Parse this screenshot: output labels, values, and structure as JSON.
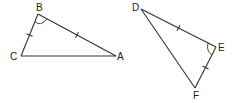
{
  "diagram": {
    "type": "congruent-triangles",
    "stroke_color": "#333333",
    "background": "#ffffff",
    "triangles": [
      {
        "name": "ABC",
        "vertices": {
          "A": {
            "label": "A",
            "x": 116,
            "y": 56
          },
          "B": {
            "label": "B",
            "x": 38,
            "y": 14
          },
          "C": {
            "label": "C",
            "x": 21,
            "y": 56
          }
        },
        "marks": {
          "BC": "single-tick",
          "AB": "single-tick",
          "angle_B": "arc"
        }
      },
      {
        "name": "DEF",
        "vertices": {
          "D": {
            "label": "D",
            "x": 141,
            "y": 9
          },
          "E": {
            "label": "E",
            "x": 216,
            "y": 47
          },
          "F": {
            "label": "F",
            "x": 195,
            "y": 88
          }
        },
        "marks": {
          "DE": "single-tick",
          "EF": "single-tick",
          "angle_E": "arc"
        }
      }
    ],
    "labels": {
      "A": "A",
      "B": "B",
      "C": "C",
      "D": "D",
      "E": "E",
      "F": "F"
    }
  }
}
